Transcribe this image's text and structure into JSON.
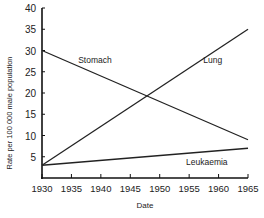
{
  "chart_data": {
    "type": "line",
    "title": "",
    "xlabel": "Date",
    "ylabel": "Rate per 100 000 male population",
    "x": [
      1930,
      1965
    ],
    "xticks": [
      1930,
      1935,
      1940,
      1945,
      1950,
      1955,
      1960,
      1965
    ],
    "yticks": [
      5,
      10,
      15,
      20,
      25,
      30,
      35,
      40
    ],
    "xlim": [
      1930,
      1965
    ],
    "ylim": [
      0,
      40
    ],
    "grid": false,
    "legend": "inline labels",
    "series": [
      {
        "name": "Stomach",
        "values": [
          30,
          9
        ]
      },
      {
        "name": "Lung",
        "values": [
          3,
          35
        ]
      },
      {
        "name": "Leukaemia",
        "values": [
          3,
          7
        ]
      }
    ],
    "annotations": [
      {
        "text": "Stomach",
        "x": 1939,
        "y": 27
      },
      {
        "text": "Lung",
        "x": 1959,
        "y": 27
      },
      {
        "text": "Leukaemia",
        "x": 1958,
        "y": 3
      }
    ]
  }
}
